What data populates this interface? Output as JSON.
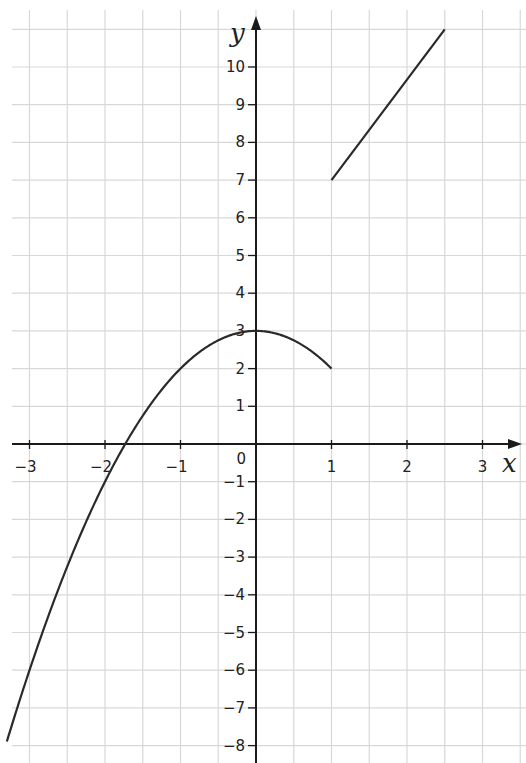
{
  "chart_data": {
    "type": "line",
    "title": "",
    "xlabel": "x",
    "ylabel": "y",
    "xlim": [
      -3.3,
      3.5
    ],
    "ylim": [
      -8.5,
      11
    ],
    "grid": true,
    "x_ticks": [
      -3,
      -2,
      -1,
      1,
      2,
      3
    ],
    "x_tick_labels": [
      "−3",
      "−2",
      "−1",
      "1",
      "2",
      "3"
    ],
    "y_ticks": [
      -8,
      -7,
      -6,
      -5,
      -4,
      -3,
      -2,
      -1,
      1,
      2,
      3,
      4,
      5,
      6,
      7,
      8,
      9,
      10
    ],
    "y_tick_labels": [
      "−8",
      "−7",
      "−6",
      "−5",
      "−4",
      "−3",
      "−2",
      "−1",
      "1",
      "2",
      "3",
      "4",
      "5",
      "6",
      "7",
      "8",
      "9",
      "10"
    ],
    "origin_label": "0",
    "series": [
      {
        "name": "piece 1 (parabola, x ≤ 1)",
        "formula": "y = 3 - x^2",
        "x": [
          -3.3,
          -3,
          -2.5,
          -2,
          -1.73,
          -1.5,
          -1,
          -0.5,
          0,
          0.5,
          1
        ],
        "y": [
          -7.89,
          -6,
          -3.25,
          -1,
          0,
          0.75,
          2,
          2.75,
          3,
          2.75,
          2
        ]
      },
      {
        "name": "piece 2 (line, x > 1)",
        "x": [
          1,
          2.5
        ],
        "y": [
          7,
          11
        ]
      }
    ]
  }
}
